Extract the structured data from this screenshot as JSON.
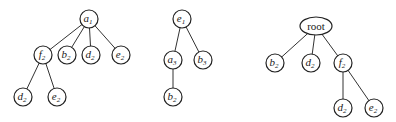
{
  "trees": [
    {
      "name": "tree-1",
      "nodes": [
        {
          "id": "a1",
          "base": "a",
          "sub": "1",
          "x": 89,
          "y": 19
        },
        {
          "id": "f2",
          "base": "f",
          "sub": "2",
          "x": 43,
          "y": 55
        },
        {
          "id": "b2",
          "base": "b",
          "sub": "2",
          "x": 67,
          "y": 55
        },
        {
          "id": "d2",
          "base": "d",
          "sub": "2",
          "x": 91,
          "y": 55
        },
        {
          "id": "e2",
          "base": "e",
          "sub": "2",
          "x": 121,
          "y": 55
        },
        {
          "id": "d2b",
          "base": "d",
          "sub": "2",
          "x": 23,
          "y": 97
        },
        {
          "id": "e2b",
          "base": "e",
          "sub": "2",
          "x": 57,
          "y": 97
        }
      ],
      "edges": [
        [
          "a1",
          "f2"
        ],
        [
          "a1",
          "b2"
        ],
        [
          "a1",
          "d2"
        ],
        [
          "a1",
          "e2"
        ],
        [
          "f2",
          "d2b"
        ],
        [
          "f2",
          "e2b"
        ]
      ]
    },
    {
      "name": "tree-2",
      "nodes": [
        {
          "id": "e1",
          "base": "e",
          "sub": "1",
          "x": 182,
          "y": 19
        },
        {
          "id": "a3",
          "base": "a",
          "sub": "3",
          "x": 173,
          "y": 60
        },
        {
          "id": "b3",
          "base": "b",
          "sub": "3",
          "x": 203,
          "y": 60
        },
        {
          "id": "b2",
          "base": "b",
          "sub": "2",
          "x": 173,
          "y": 97
        }
      ],
      "edges": [
        [
          "e1",
          "a3"
        ],
        [
          "e1",
          "b3"
        ],
        [
          "a3",
          "b2"
        ]
      ]
    },
    {
      "name": "tree-3",
      "nodes": [
        {
          "id": "root",
          "label": "root",
          "x": 316,
          "y": 26,
          "ellipse": true
        },
        {
          "id": "b2",
          "base": "b",
          "sub": "2",
          "x": 275,
          "y": 63
        },
        {
          "id": "d2",
          "base": "d",
          "sub": "2",
          "x": 311,
          "y": 63
        },
        {
          "id": "f2",
          "base": "f",
          "sub": "2",
          "x": 343,
          "y": 63
        },
        {
          "id": "d2b",
          "base": "d",
          "sub": "2",
          "x": 343,
          "y": 108
        },
        {
          "id": "e2",
          "base": "e",
          "sub": "2",
          "x": 374,
          "y": 108
        }
      ],
      "edges": [
        [
          "root",
          "b2"
        ],
        [
          "root",
          "d2"
        ],
        [
          "root",
          "f2"
        ],
        [
          "f2",
          "d2b"
        ],
        [
          "f2",
          "e2"
        ]
      ]
    }
  ],
  "style": {
    "node_radius": 9,
    "stroke": "#222222",
    "background": "#ffffff"
  }
}
